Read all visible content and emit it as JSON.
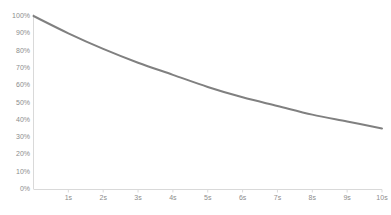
{
  "chart_data": {
    "type": "line",
    "title": "",
    "subtitle": "",
    "xlabel": "",
    "ylabel": "",
    "x": [
      0,
      1,
      2,
      3,
      4,
      5,
      6,
      7,
      8,
      9,
      10
    ],
    "xtick_labels": [
      "1s",
      "2s",
      "3s",
      "4s",
      "5s",
      "6s",
      "7s",
      "8s",
      "9s",
      "10s"
    ],
    "xtick_values": [
      1,
      2,
      3,
      4,
      5,
      6,
      7,
      8,
      9,
      10
    ],
    "ytick_labels": [
      "0%",
      "10%",
      "20%",
      "30%",
      "40%",
      "50%",
      "60%",
      "70%",
      "80%",
      "90%",
      "100%"
    ],
    "ytick_values": [
      0,
      10,
      20,
      30,
      40,
      50,
      60,
      70,
      80,
      90,
      100
    ],
    "series": [
      {
        "name": "decay",
        "values": [
          100,
          90,
          81,
          73,
          66,
          59,
          53,
          48,
          43,
          39,
          35
        ]
      }
    ],
    "xlim": [
      0,
      10
    ],
    "ylim": [
      0,
      100
    ],
    "grid": false,
    "legend": false,
    "legend_position": "none",
    "line_color": "#808080",
    "axis_color": "#d9d9d9",
    "tick_text_color": "#8c8c8c",
    "background_color": "#ffffff",
    "line_width": 2
  }
}
